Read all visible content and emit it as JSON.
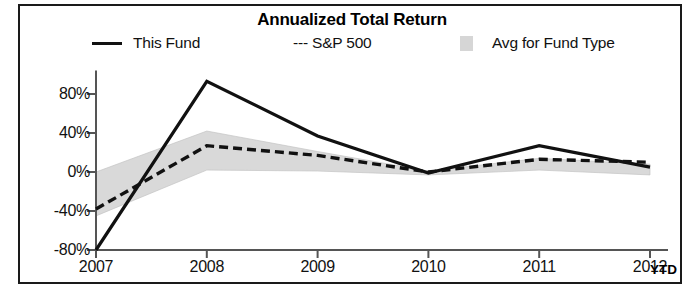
{
  "chart_data": {
    "type": "line",
    "title": "Annualized Total Return",
    "xlabel": "",
    "ylabel": "",
    "x": [
      "2007",
      "2008",
      "2009",
      "2010",
      "2011",
      "2012"
    ],
    "x_extra_label": "YTD",
    "ylim": [
      -80,
      100
    ],
    "yticks": [
      80,
      40,
      0,
      -40,
      -80
    ],
    "ytick_labels": [
      "80%",
      "40%",
      "0%",
      "-40%",
      "-80%"
    ],
    "grid": false,
    "legend_position": "top",
    "series": [
      {
        "name": "This Fund",
        "style": "solid",
        "color": "#111111",
        "values": [
          -80,
          93,
          37,
          -1,
          27,
          5
        ]
      },
      {
        "name": "S&P 500",
        "style": "dashed",
        "color": "#111111",
        "values": [
          -38,
          27,
          17,
          0,
          13,
          10
        ]
      }
    ],
    "band": {
      "name": "Avg for Fund Type",
      "color": "#d9d9d9",
      "upper": [
        0,
        42,
        21,
        1,
        14,
        8
      ],
      "lower": [
        -45,
        2,
        1,
        -3,
        2,
        -3
      ]
    }
  },
  "legend": {
    "items": [
      {
        "label": "This Fund",
        "marker": "solid-line-swatch"
      },
      {
        "label": "--- S&P 500",
        "marker": "dashed-line-swatch"
      },
      {
        "label": "Avg for Fund Type",
        "marker": "gray-band-swatch"
      }
    ]
  },
  "colors": {
    "line": "#111111",
    "band": "#d9d9d9",
    "axis": "#555555",
    "frame": "#1a1a1a"
  }
}
